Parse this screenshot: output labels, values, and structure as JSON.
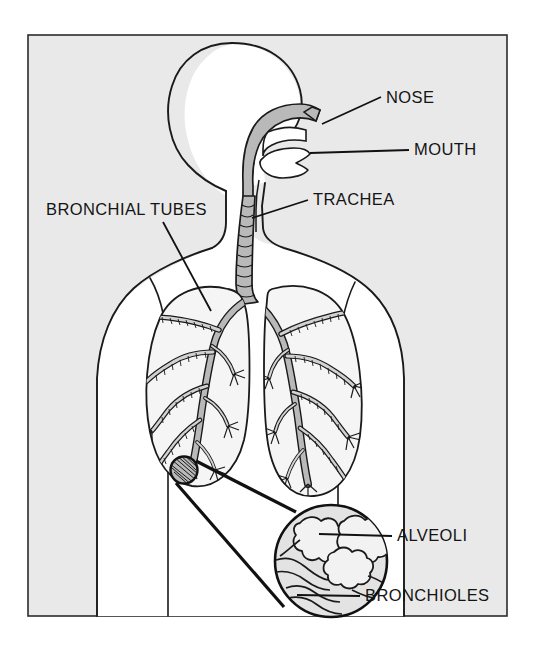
{
  "figure": {
    "frame": {
      "x": 28,
      "y": 35,
      "width": 479,
      "height": 581,
      "background_color": "#e9e9e9",
      "border_color": "#2b2b2b"
    },
    "body_silhouette_color": "#ffffff",
    "outline_color": "#1a1a1a",
    "airway_fill_color": "#b9b9b9",
    "lung_fill_color": "#f5f5f5"
  },
  "labels": [
    {
      "id": "nose",
      "text": "NOSE",
      "text_x": 386,
      "text_y": 103,
      "anchor": "start",
      "leader": "M 381 97 L 322 124"
    },
    {
      "id": "mouth",
      "text": "MOUTH",
      "text_x": 414,
      "text_y": 155,
      "anchor": "start",
      "leader": "M 409 150 L 310 153"
    },
    {
      "id": "trachea",
      "text": "TRACHEA",
      "text_x": 313,
      "text_y": 205,
      "anchor": "start",
      "leader": "M 308 200 L 252 218"
    },
    {
      "id": "bronchial-tubes",
      "text": "BRONCHIAL TUBES",
      "text_x": 46,
      "text_y": 215,
      "anchor": "start",
      "leader": "M 163 222 L 211 311"
    },
    {
      "id": "alveoli",
      "text": "ALVEOLI",
      "text_x": 397,
      "text_y": 541,
      "anchor": "start",
      "leader": "M 392 536 L 319 534"
    },
    {
      "id": "bronchioles",
      "text": "BRONCHIOLES",
      "text_x": 365,
      "text_y": 601,
      "anchor": "start",
      "leader": "M 360 596 L 297 595"
    }
  ],
  "magnifier": {
    "source_circle": {
      "cx": 184,
      "cy": 470,
      "r": 14
    },
    "detail_circle": {
      "cx": 331,
      "cy": 561,
      "r": 57
    },
    "connector_top": "M 196 461 L 296 512",
    "connector_bottom": "M 176 483 L 284 607"
  },
  "parts": {
    "head": "head-profile",
    "neck": "neck",
    "torso": "torso",
    "left_lung": "left-lung",
    "right_lung": "right-lung",
    "trachea": "trachea-tube",
    "nasal_cavity": "nasal-cavity",
    "oral_cavity": "oral-cavity"
  }
}
